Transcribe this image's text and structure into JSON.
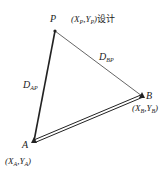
{
  "diagram": {
    "type": "survey-triangle",
    "points": {
      "P": {
        "label": "P",
        "coord_label": "(X_P,Y_P)",
        "coord_x": "X",
        "coord_x_sub": "P",
        "coord_y": "Y",
        "coord_y_sub": "P",
        "suffix": "设计",
        "x": 55,
        "y": 31
      },
      "A": {
        "label": "A",
        "coord_x": "X",
        "coord_x_sub": "A",
        "coord_y": "Y",
        "coord_y_sub": "A",
        "x": 34,
        "y": 141
      },
      "B": {
        "label": "B",
        "coord_x": "X",
        "coord_x_sub": "B",
        "coord_y": "Y",
        "coord_y_sub": "B",
        "x": 142,
        "y": 96
      }
    },
    "edges": [
      {
        "from": "A",
        "to": "P",
        "label": "D",
        "label_sub": "AP",
        "style": "thick"
      },
      {
        "from": "B",
        "to": "P",
        "label": "D",
        "label_sub": "BP",
        "style": "thin"
      },
      {
        "from": "A",
        "to": "B",
        "label": "",
        "style": "double"
      }
    ],
    "colors": {
      "line": "#222222",
      "thin_line": "#555555",
      "background": "#ffffff"
    }
  }
}
